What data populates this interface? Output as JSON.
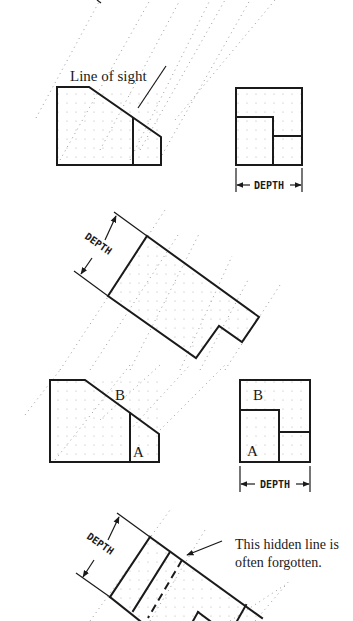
{
  "figure": {
    "type": "orthographic-auxiliary-view-diagram",
    "panels": [
      {
        "id": "panel-1",
        "label": "Line of sight",
        "depth_label": "DEPTH"
      },
      {
        "id": "panel-2",
        "depth_label": "DEPTH"
      },
      {
        "id": "panel-3",
        "labels": {
          "front_b": "B",
          "front_a": "A",
          "side_b": "B",
          "side_a": "A"
        },
        "depth_label": "DEPTH"
      },
      {
        "id": "panel-4",
        "depth_label": "DEPTH",
        "callout_line1": "This hidden line is",
        "callout_line2": "often forgotten."
      }
    ]
  },
  "colors": {
    "line": "#1a1a1a",
    "projection": "#9a9a9a",
    "background": "#ffffff"
  }
}
